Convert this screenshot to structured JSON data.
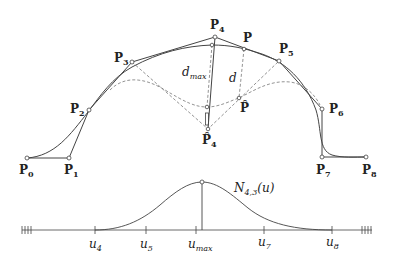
{
  "figure": {
    "colors": {
      "line": "#444444",
      "dashed": "#777777",
      "background": "#ffffff"
    }
  },
  "control_points": [
    {
      "name": "P",
      "sub": "0",
      "x": 27,
      "y": 158
    },
    {
      "name": "P",
      "sub": "1",
      "x": 69,
      "y": 158
    },
    {
      "name": "P",
      "sub": "2",
      "x": 89,
      "y": 110
    },
    {
      "name": "P",
      "sub": "3",
      "x": 132,
      "y": 62
    },
    {
      "name": "P",
      "sub": "4",
      "x": 215,
      "y": 37
    },
    {
      "name": "P",
      "sub": "5",
      "x": 279,
      "y": 61
    },
    {
      "name": "P",
      "sub": "6",
      "x": 322,
      "y": 109
    },
    {
      "name": "P",
      "sub": "7",
      "x": 322,
      "y": 157
    },
    {
      "name": "P",
      "sub": "8",
      "x": 366,
      "y": 157
    }
  ],
  "labels": {
    "p0": "P",
    "p0_sub": "0",
    "p1": "P",
    "p1_sub": "1",
    "p2": "P",
    "p2_sub": "2",
    "p3": "P",
    "p3_sub": "3",
    "p4": "P",
    "p4_sub": "4",
    "p5": "P",
    "p5_sub": "5",
    "p6": "P",
    "p6_sub": "6",
    "p7": "P",
    "p7_sub": "7",
    "p8": "P",
    "p8_sub": "8",
    "p_point": "P",
    "p_hat": "P̂",
    "p4_hat": "P̂",
    "p4_hat_sub": "4",
    "d_max": "d",
    "d_max_sub": "max",
    "d": "d",
    "basis": "N",
    "basis_sub": "4,3",
    "basis_arg": "(u)"
  },
  "axis": {
    "ticks": [
      {
        "label": "u",
        "sub": "4",
        "x": 95
      },
      {
        "label": "u",
        "sub": "5",
        "x": 146
      },
      {
        "label": "u",
        "sub": "max",
        "x": 201
      },
      {
        "label": "u",
        "sub": "7",
        "x": 264
      },
      {
        "label": "u",
        "sub": "8",
        "x": 332
      }
    ]
  }
}
